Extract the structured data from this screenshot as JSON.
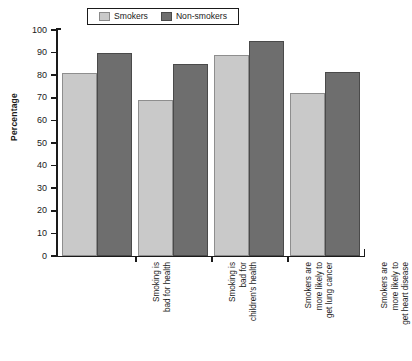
{
  "chart_data": {
    "type": "bar",
    "title": "",
    "xlabel": "",
    "ylabel": "Percentage",
    "ylim": [
      0,
      100
    ],
    "yticks": [
      0,
      10,
      20,
      30,
      40,
      50,
      60,
      70,
      80,
      90,
      100
    ],
    "grid": false,
    "legend_position": "top-center",
    "categories": [
      "Smoking is\nbad for health",
      "Smoking is\nbad for\nchildren's health",
      "Smokers are\nmore likely to\nget lung cancer",
      "Smokers are\nmore likely to\nget heart disease"
    ],
    "series": [
      {
        "name": "Smokers",
        "color": "#c9c9c9",
        "values": [
          81,
          69,
          89,
          72
        ]
      },
      {
        "name": "Non-smokers",
        "color": "#6e6e6e",
        "values": [
          90,
          85,
          95,
          81.5
        ]
      }
    ]
  },
  "axis": {
    "y_title": "Percentage",
    "tick_labels": [
      "100",
      "90",
      "80",
      "70",
      "60",
      "50",
      "40",
      "30",
      "20",
      "10",
      "0"
    ]
  },
  "legend": {
    "items": [
      {
        "label": "Smokers",
        "swatch": "legend-swatch-smokers"
      },
      {
        "label": "Non-smokers",
        "swatch": "legend-swatch-nonsmokers"
      }
    ]
  }
}
